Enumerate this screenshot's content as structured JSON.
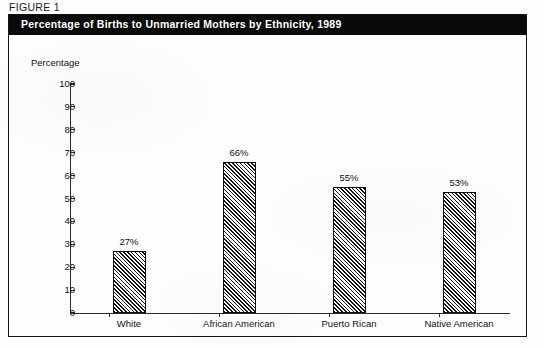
{
  "figure": {
    "label": "FIGURE 1",
    "title": "Percentage of Births to Unmarried Mothers by Ethnicity, 1989"
  },
  "colors": {
    "title_bar_background": "#0a0a0a",
    "title_text": "#ffffff",
    "frame_border": "#111111",
    "axis": "#2b2b2b",
    "bar_border": "#0d0d0d",
    "bar_hatch": "#111111",
    "page_background": "#fdfdfd"
  },
  "chart_data": {
    "type": "bar",
    "title": "Percentage of Births to Unmarried Mothers by Ethnicity, 1989",
    "xlabel": "",
    "ylabel": "Percentage",
    "categories": [
      "White",
      "African American",
      "Puerto Rican",
      "Native American"
    ],
    "values": [
      27,
      66,
      55,
      53
    ],
    "value_labels": [
      "27%",
      "66%",
      "55%",
      "53%"
    ],
    "ylim": [
      0,
      100
    ],
    "ytick_step": 10,
    "yticks": [
      100,
      90,
      80,
      70,
      60,
      50,
      40,
      30,
      20,
      10,
      0
    ],
    "ytick_labels": [
      "100",
      "90",
      "80",
      "70",
      "60",
      "50",
      "40",
      "30",
      "20",
      "10",
      "0"
    ],
    "grid": false,
    "legend": null,
    "bar_fill": "diagonal-hatch"
  }
}
